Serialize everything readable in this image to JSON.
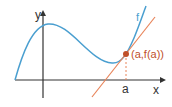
{
  "diagram": {
    "axes": {
      "x_label": "x",
      "y_label": "y"
    },
    "curve": {
      "label": "f",
      "color": "#4a9fd0"
    },
    "tangent": {
      "color": "#e8845a"
    },
    "point": {
      "label": "(a,f(a))",
      "color": "#c0502a"
    },
    "tick": {
      "label": "a"
    },
    "axis_color": "#333333"
  }
}
